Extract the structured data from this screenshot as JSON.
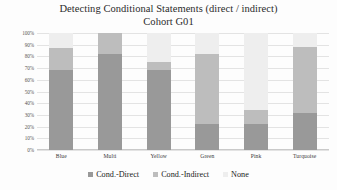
{
  "chart_data": {
    "type": "bar",
    "subtype": "stacked-column-100",
    "title": "Detecting Conditional Statements (direct / indirect)",
    "subtitle": "Cohort G01",
    "xlabel": "",
    "ylabel": "",
    "ylim": [
      0,
      100
    ],
    "grid": true,
    "legend_position": "bottom",
    "categories": [
      "Blue",
      "Multi",
      "Yellow",
      "Green",
      "Pink",
      "Turquoise"
    ],
    "ytick_labels": [
      "100%",
      "90%",
      "80%",
      "70%",
      "60%",
      "50%",
      "40%",
      "30%",
      "20%",
      "10%",
      "0%"
    ],
    "ytick_values": [
      100,
      90,
      80,
      70,
      60,
      50,
      40,
      30,
      20,
      10,
      0
    ],
    "series": [
      {
        "name": "Cond.-Direct",
        "color": "#999999",
        "values": [
          68,
          82,
          68,
          22,
          22,
          32
        ]
      },
      {
        "name": "Cond.-Indirect",
        "color": "#bdbdbd",
        "values": [
          19,
          18,
          7,
          60,
          12,
          56
        ]
      },
      {
        "name": "None",
        "color": "#eeeeee",
        "values": [
          13,
          0,
          25,
          18,
          66,
          12
        ]
      }
    ]
  },
  "legend": {
    "items": [
      {
        "label": "Cond.-Direct",
        "color": "#999999"
      },
      {
        "label": "Cond.-Indirect",
        "color": "#bdbdbd"
      },
      {
        "label": "None",
        "color": "#eeeeee"
      }
    ]
  }
}
